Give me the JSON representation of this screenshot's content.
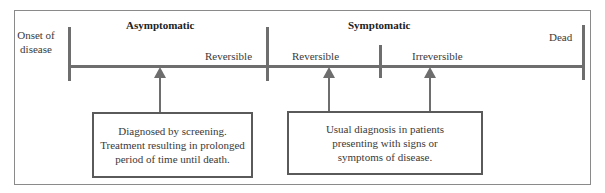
{
  "diagram": {
    "type": "timeline",
    "phases": {
      "asymptomatic": "Asymptomatic",
      "symptomatic": "Symptomatic"
    },
    "labels": {
      "onset": "Onset of disease",
      "reversible_1": "Reversible",
      "reversible_2": "Reversible",
      "irreversible": "Irreversible",
      "dead": "Dead"
    },
    "boxes": {
      "screening": "Diagnosed by screening. Treatment resulting in prolonged period of time until death.",
      "usual": "Usual diagnosis in patients presenting with signs or symptoms of disease."
    },
    "colors": {
      "line": "#6e6e6e",
      "frame": "#8a8a8a",
      "box_border": "#5a5a5a"
    }
  }
}
